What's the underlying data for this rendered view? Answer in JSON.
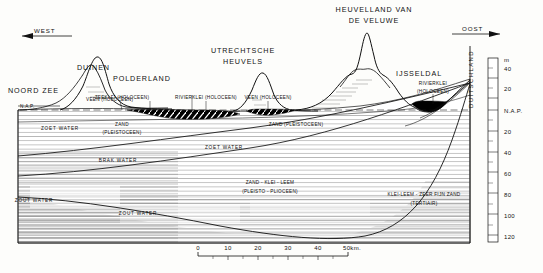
{
  "figure": {
    "type": "geological-cross-section",
    "orientation_left": "WEST",
    "orientation_right": "OOST"
  },
  "directions": {
    "west": "WEST",
    "east": "OOST"
  },
  "titles": {
    "veluwe_line1": "HEUVELLAND VAN",
    "veluwe_line2": "DE VELUWE",
    "utrecht_line1": "UTRECHTSCHE",
    "utrecht_line2": "HEUVELS"
  },
  "regions": {
    "noordzee": "NOORD ZEE",
    "duinen": "DUINEN",
    "polderland": "POLDERLAND",
    "ijsseldal": "IJSSELDAL",
    "duitschland": "DUITSCHLAND"
  },
  "datum": {
    "nap_left": "N.A.P.",
    "nap_axis": "N.A.P."
  },
  "strata": {
    "zeeklei": "ZEEKLEI (HOLOCEEN)",
    "veen_left": "VEEN (HOLOCEEN)",
    "rivierklei_mid": "RIVIERKLEI (HOLOCEEN)",
    "veen_right": "VEEN (HOLOCEEN)",
    "rivierklei_ijssel_line1": "RIVIERKLEI",
    "rivierklei_ijssel_line2": "(HOLOCEEN)",
    "zand_pleistoceen_left_line1": "ZAND",
    "zand_pleistoceen_left_line2": "(PLEISTOCEEN)",
    "zand_pleistoceen_right": "ZAND (PLEISTOCEEN)",
    "zand_klei_leem_line1": "ZAND - KLEI - LEEM",
    "zand_klei_leem_line2": "(PLEISTO - PLIOCEEN)",
    "tertiair_line1": "KLEI-LEEM - ZEER FIJN ZAND",
    "tertiair_line2": "(TERTIAIR)"
  },
  "water": {
    "zoet_left": "ZOET WATER",
    "zoet_mid": "ZOET WATER",
    "brak": "BRAK WATER",
    "zout_left": "ZOUT WATER",
    "zout_mid": "ZOUT WATER"
  },
  "vertical_scale": {
    "unit": "m",
    "ticks": [
      "40",
      "20",
      "N.A.P.",
      "20",
      "40",
      "60",
      "80",
      "100",
      "120"
    ]
  },
  "horizontal_scale": {
    "ticks": [
      "0",
      "10",
      "20",
      "30",
      "40",
      "50km."
    ]
  },
  "colors": {
    "ink": "#111111",
    "hatch": "#6c6c6c",
    "paper": "#fdfdfb",
    "peat_fill": "#000000"
  }
}
